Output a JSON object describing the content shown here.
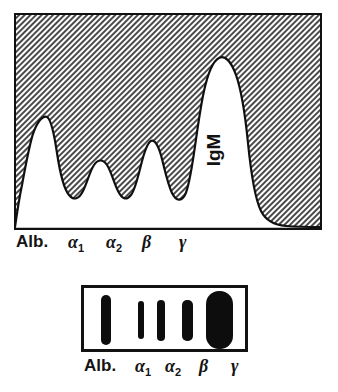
{
  "figure": {
    "annotation": "IgM"
  },
  "scan": {
    "axis_labels": [
      {
        "name": "albumin",
        "text": "Alb.",
        "greek": "",
        "sub": ""
      },
      {
        "name": "alpha-1",
        "text": "",
        "greek": "α",
        "sub": "1"
      },
      {
        "name": "alpha-2",
        "text": "",
        "greek": "α",
        "sub": "2"
      },
      {
        "name": "beta",
        "text": "",
        "greek": "β",
        "sub": ""
      },
      {
        "name": "gamma",
        "text": "",
        "greek": "γ",
        "sub": ""
      }
    ],
    "peak_annotation": "IgM"
  },
  "gel": {
    "axis_labels": [
      {
        "name": "albumin",
        "text": "Alb.",
        "greek": "",
        "sub": ""
      },
      {
        "name": "alpha-1",
        "text": "",
        "greek": "α",
        "sub": "1"
      },
      {
        "name": "alpha-2",
        "text": "",
        "greek": "α",
        "sub": "2"
      },
      {
        "name": "beta",
        "text": "",
        "greek": "β",
        "sub": ""
      },
      {
        "name": "gamma",
        "text": "",
        "greek": "γ",
        "sub": ""
      }
    ],
    "bands": [
      {
        "name": "albumin",
        "x": 17,
        "y": 7,
        "w": 10,
        "h": 50,
        "radius": 5,
        "intensity": "strong"
      },
      {
        "name": "alpha-1",
        "x": 54,
        "y": 13,
        "w": 6,
        "h": 38,
        "radius": 3,
        "intensity": "faint"
      },
      {
        "name": "alpha-2",
        "x": 73,
        "y": 12,
        "w": 8,
        "h": 41,
        "radius": 4,
        "intensity": "medium"
      },
      {
        "name": "beta",
        "x": 98,
        "y": 12,
        "w": 11,
        "h": 41,
        "radius": 5,
        "intensity": "medium"
      },
      {
        "name": "gamma",
        "x": 122,
        "y": 3,
        "w": 27,
        "h": 58,
        "radius": 13,
        "intensity": "very-strong"
      }
    ]
  },
  "chart_data": {
    "type": "area",
    "subtitle": "Monoclonal IgM spike in the gamma region",
    "xlabel": "Electrophoretic fraction",
    "ylabel": "Optical density",
    "grid": false,
    "legend": null,
    "xlim": [
      0,
      100
    ],
    "ylim": [
      0,
      100
    ],
    "tick_labels": [
      "Alb.",
      "α₁",
      "α₂",
      "β",
      "γ"
    ],
    "tick_positions": [
      11,
      26,
      38,
      47,
      62
    ],
    "annotations": [
      {
        "text": "IgM",
        "x": 62,
        "y": 55,
        "rotation": 90
      }
    ],
    "categories": [
      "Alb.",
      "α₁",
      "α₂",
      "β",
      "γ"
    ],
    "values": [
      95,
      33,
      30,
      42,
      100
    ],
    "series": [
      {
        "name": "Optical density trace",
        "fill": "hatched",
        "x": [
          0,
          2,
          5,
          8,
          11,
          14,
          17,
          20,
          23,
          26,
          29,
          32,
          35,
          38,
          41,
          44,
          47,
          50,
          53,
          56,
          59,
          62,
          65,
          68,
          70,
          72,
          74,
          78,
          85,
          92,
          100
        ],
        "y": [
          0,
          3,
          14,
          55,
          95,
          60,
          18,
          10,
          22,
          33,
          20,
          12,
          24,
          30,
          16,
          14,
          42,
          30,
          12,
          10,
          40,
          82,
          98,
          100,
          96,
          80,
          36,
          8,
          4,
          3,
          3
        ]
      }
    ],
    "peaks": [
      {
        "name": "Albumin",
        "x": 11,
        "height": 95,
        "note": "tall narrow peak"
      },
      {
        "name": "Alpha-1",
        "x": 26,
        "height": 33,
        "note": "small rounded peak"
      },
      {
        "name": "Alpha-2",
        "x": 38,
        "height": 30,
        "note": "small rounded peak"
      },
      {
        "name": "Beta",
        "x": 47,
        "height": 42,
        "note": "moderate rounded peak"
      },
      {
        "name": "Gamma",
        "x": 67,
        "height": 100,
        "note": "broad tall monoclonal IgM spike"
      }
    ]
  }
}
